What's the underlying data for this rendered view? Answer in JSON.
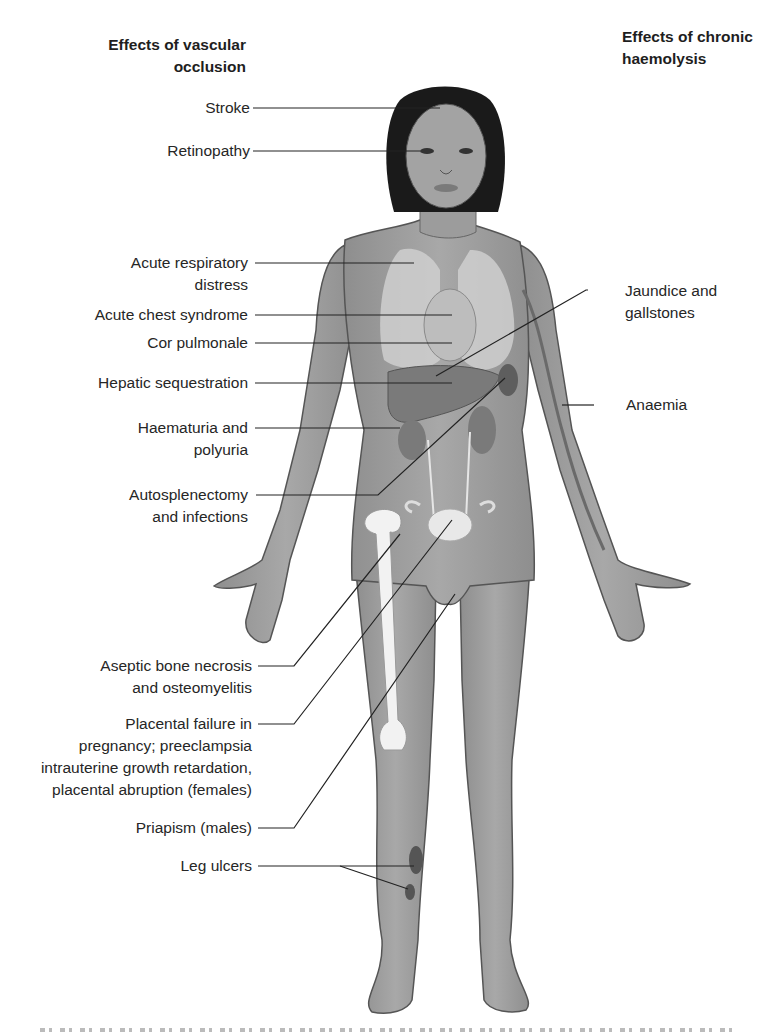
{
  "headings": {
    "left": [
      "Effects of vascular",
      "occlusion"
    ],
    "right": [
      "Effects of chronic",
      "haemolysis"
    ]
  },
  "labels_left": [
    {
      "id": "stroke",
      "lines": [
        "Stroke"
      ]
    },
    {
      "id": "retinopathy",
      "lines": [
        "Retinopathy"
      ]
    },
    {
      "id": "acute-respiratory-distress",
      "lines": [
        "Acute respiratory",
        "distress"
      ]
    },
    {
      "id": "acute-chest-syndrome",
      "lines": [
        "Acute chest syndrome"
      ]
    },
    {
      "id": "cor-pulmonale",
      "lines": [
        "Cor pulmonale"
      ]
    },
    {
      "id": "hepatic-sequestration",
      "lines": [
        "Hepatic sequestration"
      ]
    },
    {
      "id": "haematuria-polyuria",
      "lines": [
        "Haematuria and",
        "polyuria"
      ]
    },
    {
      "id": "autosplenectomy",
      "lines": [
        "Autosplenectomy",
        "and infections"
      ]
    },
    {
      "id": "aseptic-bone-necrosis",
      "lines": [
        "Aseptic bone necrosis",
        "and osteomyelitis"
      ]
    },
    {
      "id": "placental-failure",
      "lines": [
        "Placental failure in",
        "pregnancy; preeclampsia",
        "intrauterine growth retardation,",
        "placental abruption (females)"
      ]
    },
    {
      "id": "priapism",
      "lines": [
        "Priapism (males)"
      ]
    },
    {
      "id": "leg-ulcers",
      "lines": [
        "Leg ulcers"
      ]
    }
  ],
  "labels_right": [
    {
      "id": "jaundice-gallstones",
      "lines": [
        "Jaundice and",
        "gallstones"
      ]
    },
    {
      "id": "anaemia",
      "lines": [
        "Anaemia"
      ]
    }
  ],
  "colors": {
    "skin": "#9a9a9a",
    "skin_dark": "#6e6e6e",
    "hair": "#1a1a1a",
    "organ_light": "#cfcfcf",
    "organ_dark": "#6a6a6a",
    "bone": "#f2f2f2",
    "leader_line": "#222222",
    "text": "#262626"
  }
}
